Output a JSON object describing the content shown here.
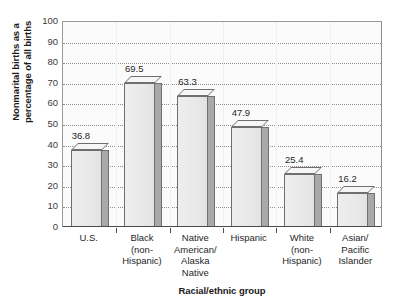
{
  "chart_data": {
    "type": "bar",
    "title": "",
    "xlabel": "Racial/ethnic group",
    "ylabel": "Nonmarital births as a percentage of all births",
    "ylabel_lines": [
      "Nonmarital births as a",
      "percentage of all births"
    ],
    "categories": [
      "U.S.",
      "Black (non-Hispanic)",
      "Native American/ Alaska Native",
      "Hispanic",
      "White (non-Hispanic)",
      "Asian/ Pacific Islander"
    ],
    "category_lines": [
      [
        "U.S."
      ],
      [
        "Black",
        "(non-",
        "Hispanic)"
      ],
      [
        "Native",
        "American/",
        "Alaska",
        "Native"
      ],
      [
        "Hispanic"
      ],
      [
        "White",
        "(non-",
        "Hispanic)"
      ],
      [
        "Asian/",
        "Pacific",
        "Islander"
      ]
    ],
    "values": [
      36.8,
      69.5,
      63.3,
      47.9,
      25.4,
      16.2
    ],
    "value_labels": [
      "36.8",
      "69.5",
      "63.3",
      "47.9",
      "25.4",
      "16.2"
    ],
    "ylim": [
      0,
      100
    ],
    "ytick_step": 10,
    "ytick_labels": [
      "100",
      "90",
      "80",
      "70",
      "60",
      "50",
      "40",
      "30",
      "20",
      "10",
      "0"
    ],
    "grid": true,
    "grid_style": "dotted-horizontal",
    "legend": false,
    "legend_position": "none",
    "bar_style": "3d-extruded",
    "colors": {
      "bar_front": "#e9e9e9",
      "bar_side": "#a9a9a9",
      "bar_top": "#f6f6f6",
      "bar_outline": "#6f6f6f",
      "plot_background": "#fbfbfb",
      "axis": "#4a4a4a",
      "gridline": "#8e8e8e",
      "text": "#1f1f1f"
    }
  }
}
